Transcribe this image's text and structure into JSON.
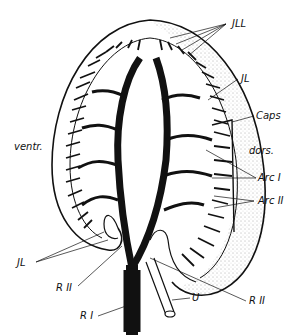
{
  "figure": {
    "colors": {
      "ink": "#111111",
      "background": "#ffffff",
      "stipple": "#555555"
    }
  },
  "labels": {
    "jll": "JLL",
    "jl_top": "JL",
    "caps": "Caps",
    "dors": "dors.",
    "ventr": "ventr.",
    "arc1": "Arc I",
    "arc2": "Arc II",
    "jl_bottom": "JL",
    "r2_left": "R II",
    "r2_right": "R II",
    "r1": "R I",
    "u": "U"
  }
}
